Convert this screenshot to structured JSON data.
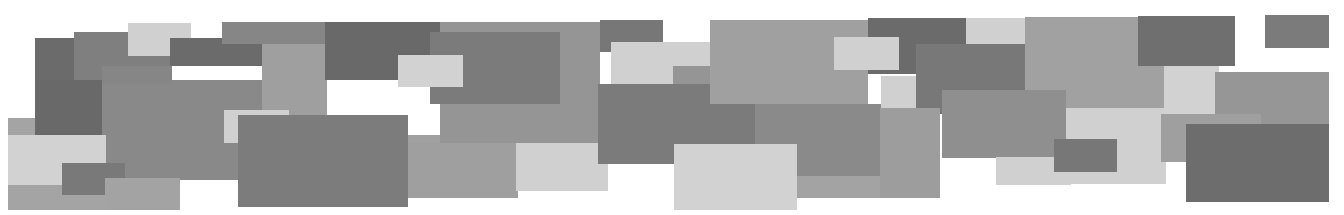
{
  "canvas": {
    "width": 1344,
    "height": 215,
    "background": "#ffffff"
  },
  "rects": [
    {
      "x": 8,
      "y": 118,
      "w": 170,
      "h": 92,
      "color": "#a9a9a9"
    },
    {
      "x": 35,
      "y": 38,
      "w": 70,
      "h": 98,
      "color": "#6e6e6e"
    },
    {
      "x": 74,
      "y": 32,
      "w": 96,
      "h": 48,
      "color": "#838383"
    },
    {
      "x": 35,
      "y": 80,
      "w": 68,
      "h": 56,
      "color": "#6c6c6c"
    },
    {
      "x": 102,
      "y": 80,
      "w": 160,
      "h": 100,
      "color": "#8d8d8d"
    },
    {
      "x": 102,
      "y": 66,
      "w": 70,
      "h": 18,
      "color": "#8a8a8a"
    },
    {
      "x": 128,
      "y": 23,
      "w": 63,
      "h": 33,
      "color": "#d6d6d6"
    },
    {
      "x": 170,
      "y": 38,
      "w": 120,
      "h": 28,
      "color": "#6e6e6e"
    },
    {
      "x": 222,
      "y": 22,
      "w": 110,
      "h": 22,
      "color": "#8a8a8a"
    },
    {
      "x": 262,
      "y": 44,
      "w": 65,
      "h": 95,
      "color": "#a4a4a4"
    },
    {
      "x": 325,
      "y": 22,
      "w": 115,
      "h": 58,
      "color": "#6c6c6c"
    },
    {
      "x": 8,
      "y": 135,
      "w": 98,
      "h": 50,
      "color": "#d8d8d8"
    },
    {
      "x": 8,
      "y": 185,
      "w": 170,
      "h": 25,
      "color": "#a9a9a9"
    },
    {
      "x": 62,
      "y": 163,
      "w": 63,
      "h": 32,
      "color": "#7c7c7c"
    },
    {
      "x": 105,
      "y": 178,
      "w": 75,
      "h": 32,
      "color": "#a8a8a8"
    },
    {
      "x": 224,
      "y": 110,
      "w": 65,
      "h": 33,
      "color": "#d6d6d6"
    },
    {
      "x": 238,
      "y": 115,
      "w": 170,
      "h": 92,
      "color": "#808080"
    },
    {
      "x": 408,
      "y": 135,
      "w": 40,
      "h": 63,
      "color": "#a6a6a6"
    },
    {
      "x": 440,
      "y": 22,
      "w": 160,
      "h": 122,
      "color": "#999999"
    },
    {
      "x": 430,
      "y": 32,
      "w": 130,
      "h": 72,
      "color": "#7e7e7e"
    },
    {
      "x": 398,
      "y": 55,
      "w": 65,
      "h": 32,
      "color": "#d8d8d8"
    },
    {
      "x": 408,
      "y": 143,
      "w": 110,
      "h": 55,
      "color": "#a3a3a3"
    },
    {
      "x": 516,
      "y": 143,
      "w": 92,
      "h": 48,
      "color": "#d6d6d6"
    },
    {
      "x": 600,
      "y": 20,
      "w": 63,
      "h": 32,
      "color": "#7a7a7a"
    },
    {
      "x": 611,
      "y": 42,
      "w": 100,
      "h": 43,
      "color": "#d6d6d6"
    },
    {
      "x": 673,
      "y": 66,
      "w": 40,
      "h": 20,
      "color": "#999999"
    },
    {
      "x": 598,
      "y": 84,
      "w": 160,
      "h": 80,
      "color": "#7e7e7e"
    },
    {
      "x": 710,
      "y": 20,
      "w": 158,
      "h": 84,
      "color": "#a5a5a5"
    },
    {
      "x": 755,
      "y": 104,
      "w": 128,
      "h": 72,
      "color": "#8e8e8e"
    },
    {
      "x": 674,
      "y": 144,
      "w": 123,
      "h": 66,
      "color": "#d8d8d8"
    },
    {
      "x": 797,
      "y": 176,
      "w": 90,
      "h": 22,
      "color": "#a8a8a8"
    },
    {
      "x": 868,
      "y": 18,
      "w": 98,
      "h": 56,
      "color": "#6e6e6e"
    },
    {
      "x": 834,
      "y": 37,
      "w": 65,
      "h": 33,
      "color": "#d6d6d6"
    },
    {
      "x": 966,
      "y": 18,
      "w": 64,
      "h": 28,
      "color": "#d6d6d6"
    },
    {
      "x": 916,
      "y": 44,
      "w": 113,
      "h": 70,
      "color": "#7b7b7b"
    },
    {
      "x": 881,
      "y": 76,
      "w": 35,
      "h": 32,
      "color": "#d6d6d6"
    },
    {
      "x": 880,
      "y": 108,
      "w": 60,
      "h": 90,
      "color": "#a1a1a1"
    },
    {
      "x": 1025,
      "y": 17,
      "w": 140,
      "h": 92,
      "color": "#a6a6a6"
    },
    {
      "x": 1138,
      "y": 16,
      "w": 97,
      "h": 50,
      "color": "#727272"
    },
    {
      "x": 942,
      "y": 90,
      "w": 124,
      "h": 68,
      "color": "#939393"
    },
    {
      "x": 1066,
      "y": 108,
      "w": 100,
      "h": 76,
      "color": "#d6d6d6"
    },
    {
      "x": 996,
      "y": 157,
      "w": 75,
      "h": 28,
      "color": "#d6d6d6"
    },
    {
      "x": 1054,
      "y": 139,
      "w": 63,
      "h": 33,
      "color": "#7a7a7a"
    },
    {
      "x": 1164,
      "y": 66,
      "w": 55,
      "h": 48,
      "color": "#d8d8d8"
    },
    {
      "x": 1215,
      "y": 72,
      "w": 114,
      "h": 55,
      "color": "#9a9a9a"
    },
    {
      "x": 1161,
      "y": 114,
      "w": 100,
      "h": 48,
      "color": "#a3a3a3"
    },
    {
      "x": 1186,
      "y": 124,
      "w": 143,
      "h": 78,
      "color": "#707070"
    },
    {
      "x": 1265,
      "y": 15,
      "w": 64,
      "h": 33,
      "color": "#7e7e7e"
    }
  ]
}
